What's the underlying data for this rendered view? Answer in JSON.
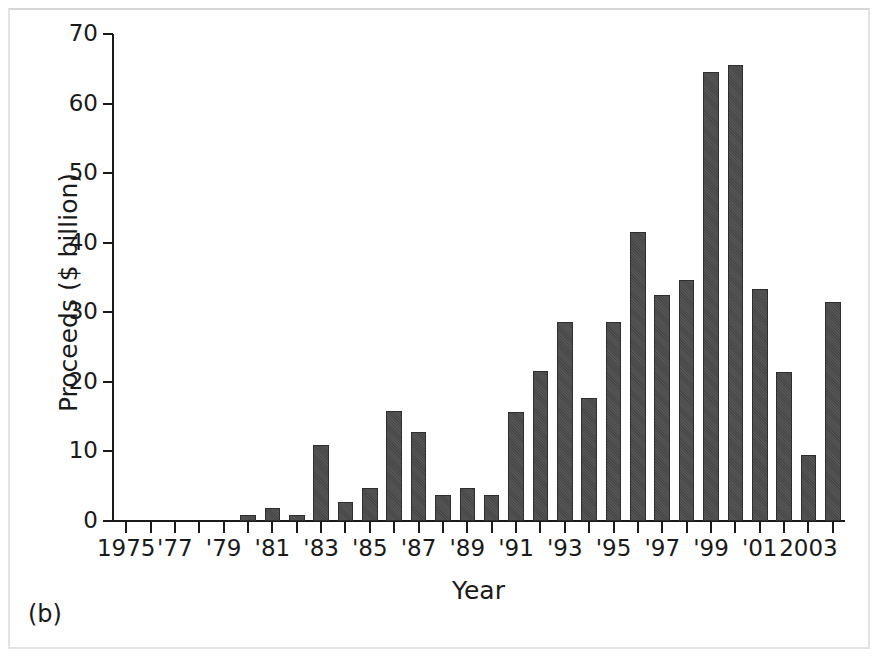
{
  "figure": {
    "panel_label": "(b)",
    "background_color": "#ffffff",
    "bar_color": "#4c4c4c",
    "axis_color": "#1a1a1a",
    "frame_color": "#e3e3e3"
  },
  "chart_data": {
    "type": "bar",
    "title": "",
    "subtitle": "",
    "xlabel": "Year",
    "ylabel": "Proceeds ($ billion)",
    "ylim": [
      0,
      70
    ],
    "ytick_labels": [
      "0",
      "10",
      "20",
      "30",
      "40",
      "50",
      "60",
      "70"
    ],
    "ytick_values": [
      0,
      10,
      20,
      30,
      40,
      50,
      60,
      70
    ],
    "grid": false,
    "legend": null,
    "legend_position": "none",
    "categories": [
      "1975",
      "1976",
      "1977",
      "1978",
      "1979",
      "1980",
      "1981",
      "1982",
      "1983",
      "1984",
      "1985",
      "1986",
      "1987",
      "1988",
      "1989",
      "1990",
      "1991",
      "1992",
      "1993",
      "1994",
      "1995",
      "1996",
      "1997",
      "1998",
      "1999",
      "2000",
      "2001",
      "2002",
      "2003",
      "2004"
    ],
    "values": [
      0,
      0,
      0,
      0,
      0,
      0.9,
      1.8,
      0.9,
      10.9,
      2.8,
      4.8,
      15.8,
      12.8,
      3.8,
      4.7,
      3.7,
      15.7,
      21.6,
      28.6,
      17.7,
      28.6,
      41.6,
      32.5,
      34.6,
      64.5,
      65.5,
      33.4,
      21.4,
      9.5,
      31.5
    ],
    "xtick_labels": [
      "1975",
      "'77",
      "'79",
      "'81",
      "'83",
      "'85",
      "'87",
      "'89",
      "'91",
      "'93",
      "'95",
      "'97",
      "'99",
      "'01",
      "2003"
    ],
    "xtick_categories": [
      "1975",
      "1977",
      "1979",
      "1981",
      "1983",
      "1985",
      "1987",
      "1989",
      "1991",
      "1993",
      "1995",
      "1997",
      "1999",
      "2001",
      "2003"
    ]
  }
}
